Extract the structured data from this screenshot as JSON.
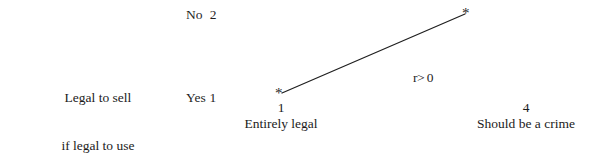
{
  "figure": {
    "background_color": "#ffffff",
    "ink_color": "#1f1f1f",
    "row_variable": {
      "name": "MJ –",
      "description_line1": "Legal to sell",
      "description_line2": "if legal to use",
      "category_high": "No  2",
      "category_low": "Yes 1"
    },
    "x_axis": {
      "left_value": "1",
      "left_label": "Entirely legal",
      "right_value": "4",
      "right_label": "Should be a crime"
    },
    "annotation": "r> 0",
    "markers": {
      "left_marker": "*",
      "right_marker": "*"
    }
  },
  "chart_data": {
    "type": "line",
    "title": "",
    "subtitle": "",
    "xlabel": "",
    "ylabel": "MJ – Legal to sell if legal to use",
    "x": [
      1,
      4
    ],
    "xticklabels": [
      "1 Entirely legal",
      "4 Should be a crime"
    ],
    "yticklabels": [
      "Yes 1",
      "No  2"
    ],
    "ylim": [
      1,
      2
    ],
    "xlim": [
      1,
      4
    ],
    "grid": false,
    "legend": "none",
    "marker": "*",
    "annotations": [
      "r> 0"
    ],
    "series": [
      {
        "name": "MJ legal to sell if legal to use",
        "values": [
          1.0,
          2.0
        ],
        "points": [
          {
            "x": 1,
            "y": 1,
            "x_label": "Entirely legal",
            "y_label": "Yes 1"
          },
          {
            "x": 4,
            "y": 2,
            "x_label": "Should be a crime",
            "y_label": "No  2"
          }
        ]
      }
    ]
  },
  "geometry": {
    "line_x1": 282,
    "line_y1": 93,
    "line_x2": 465,
    "line_y2": 14
  }
}
